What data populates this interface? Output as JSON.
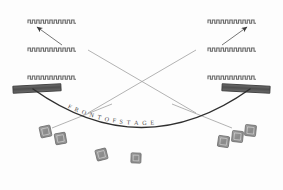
{
  "diagram": {
    "background_color": "#fdfdfd",
    "ink_color": "#555555",
    "curve_color": "#2f2f2f",
    "bar_color": "#5a5a5a",
    "block_color": "#8f8f8f",
    "stage_label": {
      "text": "FRONT OF STAGE",
      "letters": [
        "F",
        "R",
        "O",
        "N",
        "T",
        "O",
        "F",
        "S",
        "T",
        "A",
        "G",
        "E"
      ],
      "color": "#4a4a4a"
    },
    "zigzag_rows": [
      {
        "name": "upper-left-row",
        "side": "left",
        "tier": 1,
        "x": 28,
        "y": 20,
        "width": 48,
        "teeth": 11
      },
      {
        "name": "upper-right-row",
        "side": "right",
        "tier": 1,
        "x": 208,
        "y": 20,
        "width": 48,
        "teeth": 11
      },
      {
        "name": "middle-left-row",
        "side": "left",
        "tier": 2,
        "x": 28,
        "y": 48,
        "width": 48,
        "teeth": 11
      },
      {
        "name": "middle-right-row",
        "side": "right",
        "tier": 2,
        "x": 208,
        "y": 48,
        "width": 48,
        "teeth": 11
      },
      {
        "name": "lower-left-row",
        "side": "left",
        "tier": 3,
        "x": 28,
        "y": 76,
        "width": 48,
        "teeth": 11
      },
      {
        "name": "lower-right-row",
        "side": "right",
        "tier": 3,
        "x": 208,
        "y": 76,
        "width": 48,
        "teeth": 11
      }
    ],
    "bars": [
      {
        "name": "left-stage-bar",
        "side": "left",
        "x": 13,
        "y": 85,
        "width": 48,
        "height": 7,
        "rotation": -3
      },
      {
        "name": "right-stage-bar",
        "side": "right",
        "x": 222,
        "y": 85,
        "width": 48,
        "height": 7,
        "rotation": 3
      }
    ],
    "arrows": [
      {
        "name": "left-arrow",
        "side": "left",
        "from_x": 62,
        "from_y": 45,
        "to_x": 37,
        "to_y": 27,
        "direction": "up-left"
      },
      {
        "name": "right-arrow",
        "side": "right",
        "from_x": 222,
        "from_y": 45,
        "to_x": 247,
        "to_y": 27,
        "direction": "up-right"
      }
    ],
    "cross_lines": [
      {
        "name": "cross-line-left-to-right",
        "x1": 88,
        "y1": 50,
        "x2": 196,
        "y2": 113
      },
      {
        "name": "cross-line-right-to-left",
        "x1": 196,
        "y1": 50,
        "x2": 88,
        "y2": 113
      }
    ],
    "leader_lines": [
      {
        "name": "left-leader-line",
        "x1": 112,
        "y1": 104,
        "x2": 52,
        "y2": 128
      },
      {
        "name": "right-leader-line",
        "x1": 172,
        "y1": 104,
        "x2": 232,
        "y2": 128
      }
    ],
    "blocks": [
      {
        "name": "block-left-1",
        "x": 40,
        "y": 126,
        "size": 11,
        "rotation": -12
      },
      {
        "name": "block-left-2",
        "x": 55,
        "y": 133,
        "size": 11,
        "rotation": -10
      },
      {
        "name": "block-center-1",
        "x": 96,
        "y": 149,
        "size": 11,
        "rotation": -14
      },
      {
        "name": "block-center-2",
        "x": 131,
        "y": 153,
        "size": 10,
        "rotation": 2
      },
      {
        "name": "block-right-1",
        "x": 218,
        "y": 136,
        "size": 11,
        "rotation": 8
      },
      {
        "name": "block-right-2",
        "x": 232,
        "y": 131,
        "size": 11,
        "rotation": 6
      },
      {
        "name": "block-right-3",
        "x": 245,
        "y": 125,
        "size": 11,
        "rotation": 6
      }
    ]
  }
}
